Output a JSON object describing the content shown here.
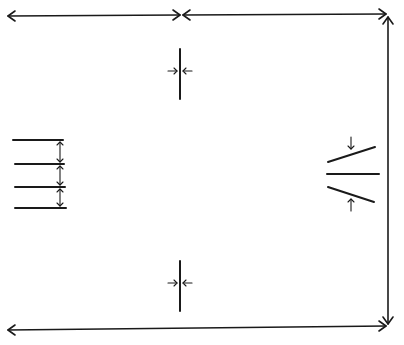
{
  "diagram": {
    "stroke_color": "#1a1a1a",
    "background": "#ffffff",
    "elements": {
      "top_left_arrow": {
        "x1": 8,
        "y1": 16,
        "x2": 180,
        "y2": 15,
        "type": "double-arrow"
      },
      "top_right_arrow": {
        "x1": 183,
        "y1": 15,
        "x2": 386,
        "y2": 14,
        "type": "double-arrow"
      },
      "right_vertical_arrow": {
        "x1": 388,
        "y1": 17,
        "x2": 388,
        "y2": 324,
        "type": "double-arrow"
      },
      "bottom_arrow": {
        "x1": 8,
        "y1": 330,
        "x2": 386,
        "y2": 326,
        "type": "double-arrow"
      },
      "top_center_gap": {
        "line_x": 180,
        "y1": 49,
        "y2": 99,
        "arrow_y": 71
      },
      "bottom_center_gap": {
        "line_x": 180,
        "y1": 261,
        "y2": 311,
        "arrow_y": 283
      },
      "left_parallel_lines": {
        "x1": 13,
        "x2": 65,
        "ys": [
          140,
          164,
          187,
          208
        ],
        "spacing_arrow_x": 60
      },
      "right_wedge": {
        "upper_line": {
          "x1": 328,
          "y1": 162,
          "x2": 375,
          "y2": 147
        },
        "middle_line": {
          "x1": 327,
          "y1": 174,
          "x2": 379,
          "y2": 174
        },
        "lower_line": {
          "x1": 328,
          "y1": 187,
          "x2": 374,
          "y2": 202
        },
        "top_arrow": {
          "x": 351,
          "y1": 137,
          "y2": 149
        },
        "bottom_arrow": {
          "x": 351,
          "y1": 211,
          "y2": 199
        }
      }
    }
  }
}
